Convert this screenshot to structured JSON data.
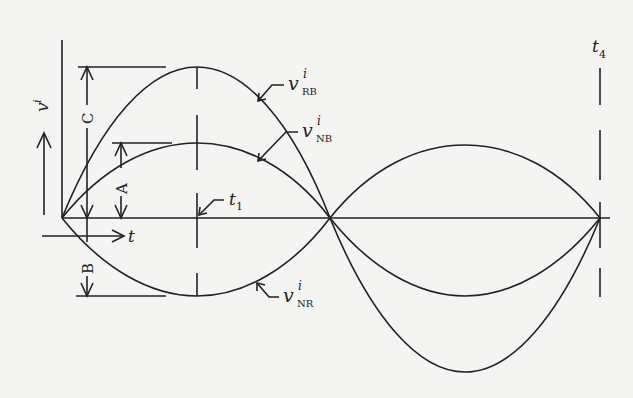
{
  "diagram": {
    "type": "waveform-diagram",
    "colors": {
      "background": "#f4f4f2",
      "stroke": "#222222"
    },
    "axes": {
      "y_label": "v",
      "y_label_superscript": "i",
      "x_label": "t"
    },
    "amplitude_labels": {
      "C": "C",
      "A": "A",
      "B": "B"
    },
    "time_markers": {
      "t1": {
        "base": "t",
        "sub": "1"
      },
      "t4": {
        "base": "t",
        "sub": "4"
      }
    },
    "curves": [
      {
        "id": "RB",
        "base": "v",
        "sup": "i",
        "sub": "RB",
        "amplitude": "C"
      },
      {
        "id": "NB",
        "base": "v",
        "sup": "i",
        "sub": "NB",
        "amplitude": "A"
      },
      {
        "id": "NR",
        "base": "v",
        "sup": "i",
        "sub": "NR",
        "amplitude": "B"
      }
    ]
  }
}
